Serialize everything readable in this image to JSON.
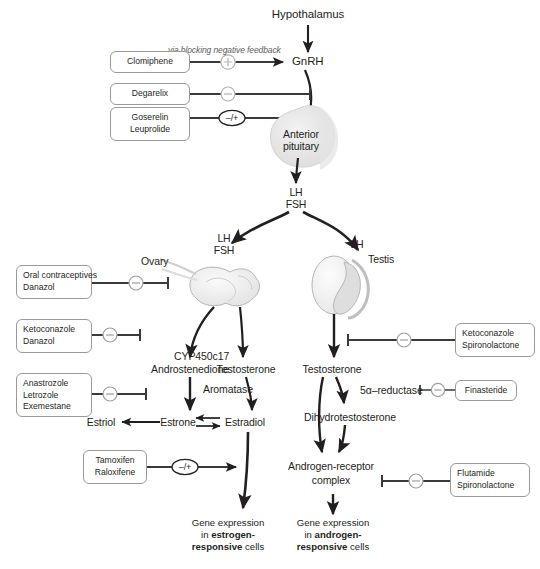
{
  "diagram": {
    "type": "pathway-diagram",
    "background": "#ffffff",
    "ink": "#231f20",
    "organ_fill": "#e8e8e8",
    "organ_stroke": "#a8a8a8",
    "box_stroke": "#9a9a9a"
  },
  "nodes": {
    "hypothalamus": "Hypothalamus",
    "gnrh": "GnRH",
    "anterior_pituitary_line1": "Anterior",
    "anterior_pituitary_line2": "pituitary",
    "lh_fsh_pituitary_line1": "LH",
    "lh_fsh_pituitary_line2": "FSH",
    "lh_fsh_ovary_line1": "LH",
    "lh_fsh_ovary_line2": "FSH",
    "lh_testis": "LH",
    "ovary": "Ovary",
    "testis": "Testis",
    "cyp450c17": "CYP450c17",
    "androstenedione": "Androstenedione",
    "testosterone_left": "Testosterone",
    "aromatase": "Aromatase",
    "estriol": "Estriol",
    "estrone": "Estrone",
    "estradiol": "Estradiol",
    "testosterone_right": "Testosterone",
    "five_alpha_reductase": "5α–reductase",
    "dihydrotestosterone": "Dihydrotestosterone",
    "androgen_receptor_line1": "Androgen-receptor",
    "androgen_receptor_line2": "complex"
  },
  "annotations": {
    "via_blocking": "via blocking negative feedback"
  },
  "gene_expression": {
    "estrogen": {
      "line1": "Gene expression",
      "line2_prefix": "in ",
      "line2_bold": "estrogen-",
      "line3_bold": "responsive",
      "line3_suffix": " cells"
    },
    "androgen": {
      "line1": "Gene expression",
      "line2_prefix": "in ",
      "line2_bold": "androgen-",
      "line3_bold": "responsive",
      "line3_suffix": " cells"
    }
  },
  "drug_boxes": [
    {
      "id": "clomiphene",
      "drugs": [
        "Clomiphene"
      ],
      "effect": "+",
      "target": "GnRH"
    },
    {
      "id": "degarelix",
      "drugs": [
        "Degarelix"
      ],
      "effect": "−",
      "target": "anterior pituitary"
    },
    {
      "id": "goserelin",
      "drugs": [
        "Goserelin",
        "Leuprolide"
      ],
      "effect": "−/+",
      "target": "anterior pituitary"
    },
    {
      "id": "oral-contraceptives",
      "drugs": [
        "Oral contraceptives",
        "Danazol"
      ],
      "effect": "−",
      "target": "ovary"
    },
    {
      "id": "ketoconazole-danazol",
      "drugs": [
        "Ketoconazole",
        "Danazol"
      ],
      "effect": "−",
      "target": "CYP450c17"
    },
    {
      "id": "aromatase-inhibitors",
      "drugs": [
        "Anastrozole",
        "Letrozole",
        "Exemestane"
      ],
      "effect": "−",
      "target": "Aromatase"
    },
    {
      "id": "serms",
      "drugs": [
        "Tamoxifen",
        "Raloxifene"
      ],
      "effect": "−/+",
      "target": "estrogen-responsive cells"
    },
    {
      "id": "ketoconazole-spiro",
      "drugs": [
        "Ketoconazole",
        "Spironolactone"
      ],
      "effect": "−",
      "target": "testis"
    },
    {
      "id": "finasteride",
      "drugs": [
        "Finasteride"
      ],
      "effect": "−",
      "target": "5α-reductase"
    },
    {
      "id": "flutamide-spiro",
      "drugs": [
        "Flutamide",
        "Spironolactone"
      ],
      "effect": "−",
      "target": "androgen-receptor complex"
    }
  ],
  "symbols": {
    "plus": "+",
    "minus": "–",
    "minus_plus": "–/+"
  }
}
